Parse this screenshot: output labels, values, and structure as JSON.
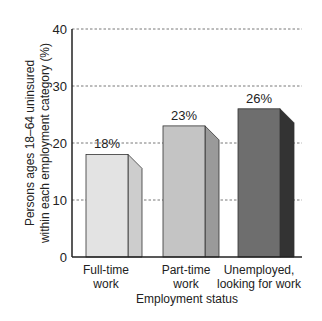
{
  "chart_data": {
    "type": "bar",
    "title": "",
    "xlabel": "Employment status",
    "ylabel_lines": [
      "Persons ages 18–64 uninsured",
      "within each employment category (%)"
    ],
    "ylabel": "Persons ages 18–64 uninsured within each employment category (%)",
    "ylim": [
      0,
      40
    ],
    "yticks": [
      0,
      10,
      20,
      30,
      40
    ],
    "grid": true,
    "legend": "none",
    "categories": [
      "Full-time work",
      "Part-time work",
      "Unemployed, looking for work"
    ],
    "category_lines": [
      [
        "Full-time",
        "work"
      ],
      [
        "Part-time",
        "work"
      ],
      [
        "Unemployed,",
        "looking for work"
      ]
    ],
    "values": [
      18,
      23,
      26
    ],
    "value_labels": [
      "18%",
      "23%",
      "26%"
    ],
    "colors": {
      "front": [
        "#e3e3e3",
        "#c4c4c4",
        "#6e6e6e"
      ],
      "side": [
        "#cdcdcd",
        "#9a9a9a",
        "#333333"
      ]
    }
  }
}
